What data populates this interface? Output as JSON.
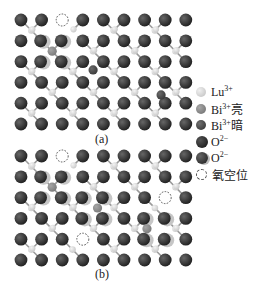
{
  "figure": {
    "panels": [
      {
        "id": "a",
        "label": "(a)",
        "label_pos": [
          103,
          140
        ],
        "origin_y": 20,
        "vacancies": [
          [
            2,
            0
          ]
        ],
        "dark_O_missing": [
          [
            2,
            0
          ]
        ],
        "displaced_O": [
          [
            1,
            1
          ],
          [
            2,
            1
          ],
          [
            1,
            2
          ],
          [
            2,
            2
          ]
        ],
        "bi_bright": [
          [
            2,
            1.5
          ]
        ],
        "bi_dark": [
          [
            3.5,
            2.4
          ],
          [
            6.8,
            3.6
          ]
        ]
      },
      {
        "id": "b",
        "label": "(b)",
        "label_pos": [
          103,
          275
        ],
        "origin_y": 156,
        "vacancies": [
          [
            2,
            0
          ],
          [
            7,
            2
          ],
          [
            3,
            4
          ]
        ],
        "dark_O_missing": [
          [
            2,
            0
          ],
          [
            7,
            2
          ],
          [
            3,
            4
          ]
        ],
        "displaced_O": [
          [
            1,
            1
          ],
          [
            2,
            1
          ],
          [
            1,
            2
          ],
          [
            2,
            2
          ],
          [
            3,
            2
          ],
          [
            4,
            2
          ],
          [
            3,
            3
          ],
          [
            4,
            3
          ],
          [
            6,
            3
          ],
          [
            7,
            3
          ],
          [
            6,
            4
          ],
          [
            7,
            4
          ]
        ],
        "bi_bright": [
          [
            2,
            1.5
          ],
          [
            4.2,
            2.5
          ],
          [
            6.6,
            3.5
          ]
        ],
        "bi_dark": []
      }
    ],
    "grid": {
      "cols": 9,
      "rows": 6,
      "x0": 21,
      "dx": 20.6,
      "dy": 20.8
    }
  },
  "legend": {
    "items": [
      {
        "symbol": "lu",
        "label": "Lu",
        "sup": "3+",
        "suffix": ""
      },
      {
        "symbol": "bi-bright",
        "label": "Bi",
        "sup": "3+",
        "suffix": "亮"
      },
      {
        "symbol": "bi-dark",
        "label": "Bi",
        "sup": "3+",
        "suffix": "暗"
      },
      {
        "symbol": "o",
        "label": "O",
        "sup": "2−",
        "suffix": ""
      },
      {
        "symbol": "o-shaded",
        "label": "O",
        "sup": "2−",
        "suffix": ""
      },
      {
        "symbol": "vacancy",
        "label": "氧空位",
        "sup": "",
        "suffix": ""
      }
    ]
  },
  "colors": {
    "oxygen": "#1f1f1f",
    "oxygen_shaded": "#2e2e2e",
    "lutetium": "#c8c8c8",
    "bi_bright": "#7a7a7a",
    "bi_dark": "#3a3a3a",
    "bond": "#9a9a9a",
    "vacancy_stroke": "#555555"
  }
}
